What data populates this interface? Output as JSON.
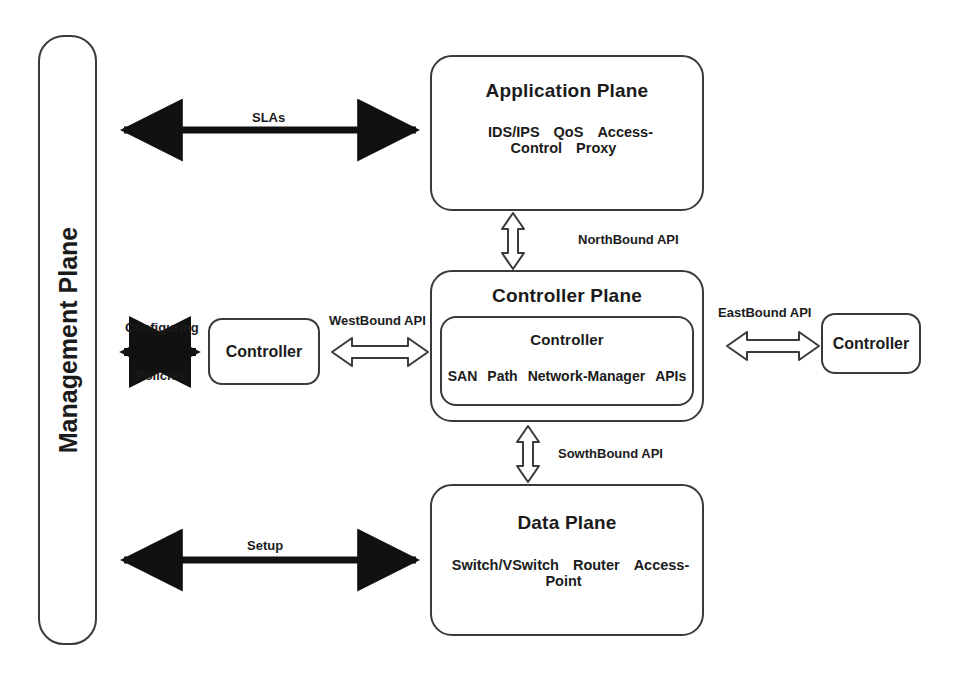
{
  "management_plane": {
    "label": "Management Plane"
  },
  "application_plane": {
    "title": "Application Plane",
    "items": [
      "IDS/IPS",
      "QoS",
      "Access-Control",
      "Proxy"
    ]
  },
  "controller_plane": {
    "title": "Controller Plane",
    "inner": {
      "title": "Controller",
      "items": [
        "SAN",
        "Path",
        "Network-Manager",
        "APIs"
      ]
    }
  },
  "data_plane": {
    "title": "Data Plane",
    "items": [
      "Switch/VSwitch",
      "Router",
      "Access-Point"
    ]
  },
  "west_controller": {
    "label": "Controller"
  },
  "east_controller": {
    "label": "Controller"
  },
  "connections": {
    "slas": "SLAs",
    "setup": "Setup",
    "configuring": "Configuring",
    "policies": "Policies",
    "northbound": "NorthBound API",
    "southbound": "SowthBound API",
    "westbound": "WestBound API",
    "eastbound": "EastBound API"
  },
  "colors": {
    "stroke": "#3a3a3a",
    "solid_arrow": "#111111",
    "text": "#1b1b1b",
    "background": "#ffffff"
  }
}
